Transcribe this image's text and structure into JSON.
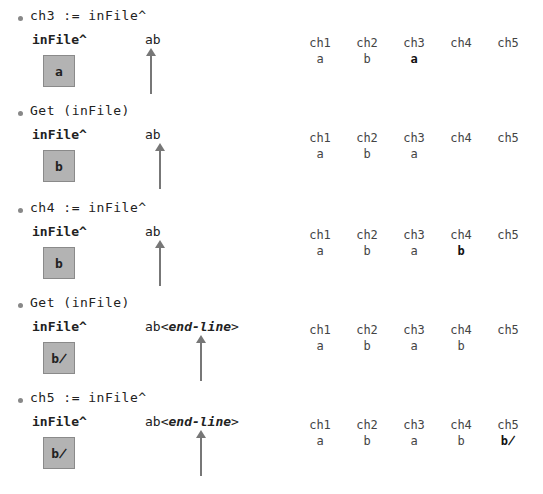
{
  "steps": [
    {
      "statement": "ch3 := inFile^",
      "buffer_label": "inFile^",
      "buffer_value": "a",
      "file_text": "ab",
      "file_suffix": "",
      "arrow_x": 150,
      "vars": [
        {
          "name": "ch1",
          "value": "a"
        },
        {
          "name": "ch2",
          "value": "b"
        },
        {
          "name": "ch3",
          "value": "a"
        },
        {
          "name": "ch4",
          "value": ""
        },
        {
          "name": "ch5",
          "value": ""
        }
      ]
    },
    {
      "statement": "Get (inFile)",
      "buffer_label": "inFile^",
      "buffer_value": "b",
      "file_text": "ab",
      "file_suffix": "",
      "arrow_x": 159,
      "vars": [
        {
          "name": "ch1",
          "value": "a"
        },
        {
          "name": "ch2",
          "value": "b"
        },
        {
          "name": "ch3",
          "value": "a"
        },
        {
          "name": "ch4",
          "value": ""
        },
        {
          "name": "ch5",
          "value": ""
        }
      ]
    },
    {
      "statement": "ch4 := inFile^",
      "buffer_label": "inFile^",
      "buffer_value": "b",
      "file_text": "ab",
      "file_suffix": "",
      "arrow_x": 159,
      "vars": [
        {
          "name": "ch1",
          "value": "a"
        },
        {
          "name": "ch2",
          "value": "b"
        },
        {
          "name": "ch3",
          "value": "a"
        },
        {
          "name": "ch4",
          "value": "b"
        },
        {
          "name": "ch5",
          "value": ""
        }
      ]
    },
    {
      "statement": "Get (inFile)",
      "buffer_label": "inFile^",
      "buffer_value": "b̸",
      "file_text": "ab<",
      "file_suffix": "end-line",
      "file_close": ">",
      "arrow_x": 200,
      "vars": [
        {
          "name": "ch1",
          "value": "a"
        },
        {
          "name": "ch2",
          "value": "b"
        },
        {
          "name": "ch3",
          "value": "a"
        },
        {
          "name": "ch4",
          "value": "b"
        },
        {
          "name": "ch5",
          "value": ""
        }
      ]
    },
    {
      "statement": "ch5 := inFile^",
      "buffer_label": "inFile^",
      "buffer_value": "b̸",
      "file_text": "ab<",
      "file_suffix": "end-line",
      "file_close": ">",
      "arrow_x": 200,
      "vars": [
        {
          "name": "ch1",
          "value": "a"
        },
        {
          "name": "ch2",
          "value": "b"
        },
        {
          "name": "ch3",
          "value": "a"
        },
        {
          "name": "ch4",
          "value": "b"
        },
        {
          "name": "ch5",
          "value": "b̸"
        }
      ]
    }
  ]
}
